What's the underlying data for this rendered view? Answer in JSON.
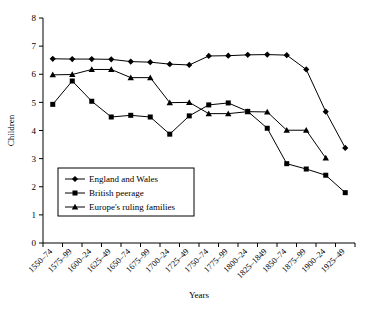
{
  "chart_data": {
    "type": "line",
    "title": "",
    "xlabel": "Years",
    "ylabel": "Children",
    "ylim": [
      0,
      8
    ],
    "ytick_step": 1,
    "grid": false,
    "legend_position": "inside-lower-left",
    "categories": [
      "1550–74",
      "1575–99",
      "1600–24",
      "1625–49",
      "1650–74",
      "1675–99",
      "1700–24",
      "1725–49",
      "1750–74",
      "1775–99",
      "1800–24",
      "1825–1849",
      "1850–74",
      "1875–99",
      "1900–24",
      "1925–49"
    ],
    "yticks": [
      "0",
      "1",
      "2",
      "3",
      "4",
      "5",
      "6",
      "7",
      "8"
    ],
    "series": [
      {
        "name": "England and Wales",
        "marker": "diamond",
        "values": [
          6.55,
          6.54,
          6.54,
          6.53,
          6.45,
          6.43,
          6.36,
          6.33,
          6.65,
          6.66,
          6.69,
          6.7,
          6.68,
          6.17,
          4.67,
          3.38
        ]
      },
      {
        "name": "British peerage",
        "marker": "square",
        "values": [
          4.93,
          5.76,
          5.04,
          4.48,
          4.54,
          4.48,
          3.87,
          4.52,
          4.91,
          4.98,
          4.68,
          4.08,
          2.82,
          2.63,
          2.41,
          1.79
        ]
      },
      {
        "name": "Europe's ruling families",
        "marker": "triangle",
        "values": [
          5.98,
          5.99,
          6.17,
          6.17,
          5.88,
          5.88,
          4.99,
          5.0,
          4.6,
          4.6,
          4.67,
          4.66,
          4.01,
          4.01,
          3.02,
          null
        ]
      }
    ]
  },
  "legend": {
    "items": [
      {
        "label": "England and Wales",
        "marker": "diamond"
      },
      {
        "label": "British peerage",
        "marker": "square"
      },
      {
        "label": "Europe's ruling families",
        "marker": "triangle"
      }
    ]
  }
}
